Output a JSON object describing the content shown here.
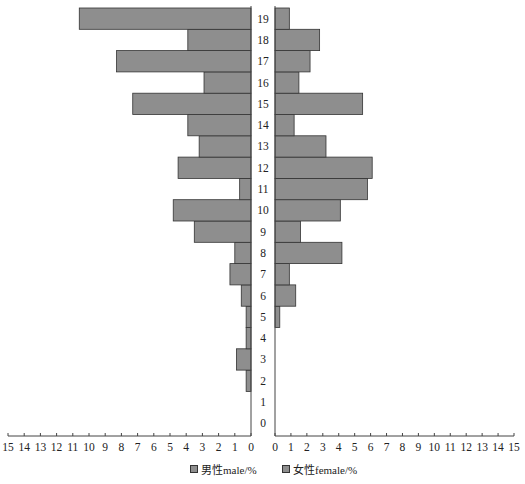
{
  "chart_data": {
    "type": "bar",
    "orientation": "horizontal-population-pyramid",
    "title": "",
    "categories": [
      0,
      1,
      2,
      3,
      4,
      5,
      6,
      7,
      8,
      9,
      10,
      11,
      12,
      13,
      14,
      15,
      16,
      17,
      18,
      19
    ],
    "series": [
      {
        "name": "男性male/%",
        "side": "left",
        "values": [
          0,
          0,
          0.3,
          0.9,
          0.3,
          0.3,
          0.6,
          1.3,
          1.0,
          3.5,
          4.8,
          0.7,
          4.5,
          3.2,
          3.9,
          7.3,
          2.9,
          8.3,
          3.9,
          10.6
        ]
      },
      {
        "name": "女性female/%",
        "side": "right",
        "values": [
          0,
          0,
          0,
          0,
          0,
          0.3,
          1.3,
          0.9,
          4.2,
          1.6,
          4.1,
          5.8,
          6.1,
          3.2,
          1.2,
          5.5,
          1.5,
          2.2,
          2.8,
          0.9
        ]
      }
    ],
    "xlim": [
      0,
      15
    ],
    "left_ticks": [
      "15",
      "14",
      "13",
      "12",
      "11",
      "10",
      "9",
      "8",
      "7",
      "6",
      "5",
      "4",
      "3",
      "2",
      "1",
      "0"
    ],
    "right_ticks": [
      "0",
      "1",
      "2",
      "3",
      "4",
      "5",
      "6",
      "7",
      "8",
      "9",
      "10",
      "11",
      "12",
      "13",
      "14",
      "15"
    ],
    "xlabel": "",
    "ylabel": "",
    "grid": false,
    "legend_position": "bottom-center",
    "colors": {
      "bar_fill": "#8e8e8e",
      "bar_stroke": "#333333"
    }
  },
  "legend": {
    "male": "男性male/%",
    "female": "女性female/%"
  }
}
